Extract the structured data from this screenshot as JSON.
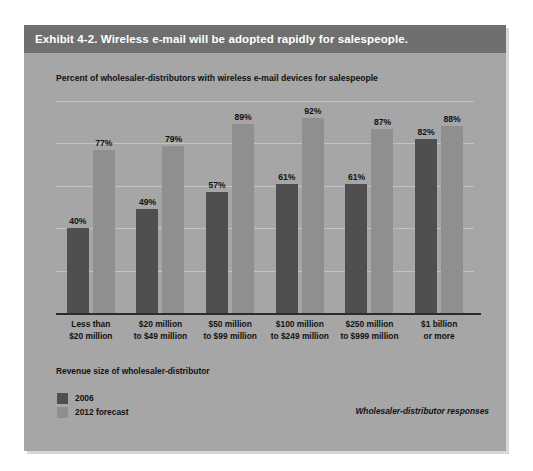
{
  "exhibit": {
    "header_title": "Exhibit 4-2. Wireless e-mail will be adopted rapidly for salespeople.",
    "subtitle": "Percent of wholesaler-distributors with wireless e-mail devices for salespeople",
    "axis_title": "Revenue size of wholesaler-distributor",
    "footnote": "Wholesaler-distributor responses"
  },
  "legend": {
    "items": [
      {
        "label": "2006",
        "color": "#4f4f4f"
      },
      {
        "label": "2012 forecast",
        "color": "#8f8f8f"
      }
    ]
  },
  "colors": {
    "header_band": "#6f6f6f",
    "card_background": "#a6a6a6",
    "gridline": "#c3c3c3",
    "axis_line": "#2c2c2c",
    "series_2006": "#4f4f4f",
    "series_2012": "#8f8f8f",
    "text": "#121212"
  },
  "chart_data": {
    "type": "bar",
    "title": "Exhibit 4-2. Wireless e-mail will be adopted rapidly for salespeople.",
    "subtitle": "Percent of wholesaler-distributors with wireless e-mail devices for salespeople",
    "xlabel": "Revenue size of wholesaler-distributor",
    "ylabel": "",
    "ylim": [
      0,
      100
    ],
    "grid": true,
    "gridline_values": [
      0,
      20,
      40,
      60,
      80,
      100
    ],
    "legend_position": "bottom-left",
    "annotation": "Wholesaler-distributor responses",
    "value_suffix": "%",
    "categories": [
      "Less than\n$20 million",
      "$20 million\nto $49 million",
      "$50 million\nto $99 million",
      "$100 million\nto $249 million",
      "$250 million\nto $999 million",
      "$1 billion\nor more"
    ],
    "category_lines": [
      [
        "Less than",
        "$20 million"
      ],
      [
        "$20 million",
        "to $49 million"
      ],
      [
        "$50 million",
        "to $99 million"
      ],
      [
        "$100 million",
        "to $249 million"
      ],
      [
        "$250 million",
        "to $999 million"
      ],
      [
        "$1 billion",
        "or more"
      ]
    ],
    "series": [
      {
        "name": "2006",
        "color": "#4f4f4f",
        "values": [
          40,
          49,
          57,
          61,
          61,
          82
        ],
        "labels": [
          "40%",
          "49%",
          "57%",
          "61%",
          "61%",
          "82%"
        ]
      },
      {
        "name": "2012 forecast",
        "color": "#8f8f8f",
        "values": [
          77,
          79,
          89,
          92,
          87,
          88
        ],
        "labels": [
          "77%",
          "79%",
          "89%",
          "92%",
          "87%",
          "88%"
        ]
      }
    ]
  }
}
